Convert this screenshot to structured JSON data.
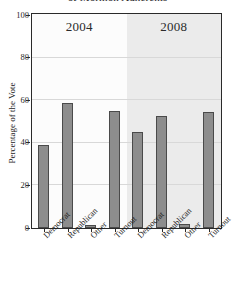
{
  "chart_data": {
    "type": "bar",
    "title": "of Mormon Adherents",
    "xlabel": "",
    "ylabel": "Percentage of the Vote",
    "ylim": [
      0,
      100
    ],
    "yticks": [
      0,
      20,
      40,
      60,
      80,
      100
    ],
    "grid": true,
    "legend": "none",
    "panels": [
      {
        "label": "2004",
        "categories": [
          "Democrat",
          "Republican",
          "Other",
          "Turnout"
        ],
        "values": [
          39,
          58.5,
          1.5,
          55
        ]
      },
      {
        "label": "2008",
        "categories": [
          "Democrat",
          "Republican",
          "Other",
          "Turnout"
        ],
        "values": [
          45,
          52.5,
          2,
          54.5
        ]
      }
    ],
    "categories": [
      "Democrat",
      "Republican",
      "Other",
      "Turnout"
    ],
    "series": [
      {
        "name": "2004",
        "values": [
          39,
          58.5,
          1.5,
          55
        ]
      },
      {
        "name": "2008",
        "values": [
          45,
          52.5,
          2,
          54.5
        ]
      }
    ],
    "colors": {
      "bar_fill": "#8d8d8d",
      "bar_outline": "#4a4a4a",
      "panel_2004_bg": "#fcfcfc",
      "panel_2008_bg": "#ebebeb",
      "gridline": "#d8d8d8",
      "frame": "#2a2a2a",
      "text": "#1f1f1f"
    }
  }
}
